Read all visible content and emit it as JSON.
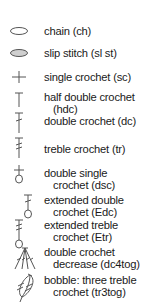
{
  "legend": {
    "items": [
      {
        "icon": "chain-oval-icon",
        "line1": "chain (ch)",
        "line2": ""
      },
      {
        "icon": "slip-stitch-filled-oval-icon",
        "line1": "slip stitch (sl st)",
        "line2": ""
      },
      {
        "icon": "single-crochet-plus-icon",
        "line1": "single crochet (sc)",
        "line2": ""
      },
      {
        "icon": "half-double-crochet-t-icon",
        "line1": "half double crochet",
        "line2": "(hdc)"
      },
      {
        "icon": "double-crochet-icon",
        "line1": "double crochet (dc)",
        "line2": ""
      },
      {
        "icon": "treble-crochet-icon",
        "line1": "treble crochet (tr)",
        "line2": ""
      },
      {
        "icon": "double-single-crochet-icon",
        "line1": "double single",
        "line2": "crochet (dsc)"
      },
      {
        "icon": "extended-double-crochet-icon",
        "line1": "extended double",
        "line2": "crochet (Edc)"
      },
      {
        "icon": "extended-treble-crochet-icon",
        "line1": "extended treble",
        "line2": "crochet (Etr)"
      },
      {
        "icon": "dc4tog-fan-icon",
        "line1": "double crochet",
        "line2": "decrease (dc4tog)"
      },
      {
        "icon": "bobble-icon",
        "line1": "bobble: three treble",
        "line2": "crochet (tr3tog)"
      }
    ]
  }
}
